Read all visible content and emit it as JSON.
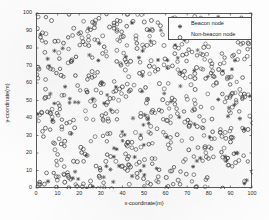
{
  "figure": {
    "title": "",
    "background_color": "#fdfdfd",
    "axes_color": "#5a5a5a"
  },
  "axes": {
    "xlabel": "x-coordinate(m)",
    "ylabel": "y-coordinate(m)",
    "xticks": [
      "0",
      "10",
      "20",
      "30",
      "40",
      "50",
      "60",
      "70",
      "80",
      "90",
      "100"
    ],
    "yticks": [
      "0",
      "10",
      "20",
      "30",
      "40",
      "50",
      "60",
      "70",
      "80",
      "90",
      "100"
    ]
  },
  "legend": {
    "position": "upper-right",
    "entries": [
      {
        "label": "Beacon node",
        "marker": "star",
        "color": "#3a3a3a"
      },
      {
        "label": "Non-beacon node",
        "marker": "circle",
        "color": "#3a3a3a"
      }
    ]
  },
  "chart_data": {
    "type": "scatter",
    "title": "",
    "xlabel": "x-coordinate(m)",
    "ylabel": "y-coordinate(m)",
    "xlim": [
      0,
      100
    ],
    "ylim": [
      0,
      100
    ],
    "xticks": [
      0,
      10,
      20,
      30,
      40,
      50,
      60,
      70,
      80,
      90,
      100
    ],
    "yticks": [
      0,
      10,
      20,
      30,
      40,
      50,
      60,
      70,
      80,
      90,
      100
    ],
    "grid": false,
    "legend_position": "upper right",
    "marker_color": "#3a3a3a",
    "series": [
      {
        "name": "Non-beacon node",
        "marker": "circle",
        "count": 560,
        "distribution": "uniform-random over 100x100 m area",
        "seed": 20240517
      },
      {
        "name": "Beacon node",
        "marker": "star",
        "count": 110,
        "distribution": "uniform-random over 100x100 m area",
        "seed": 987654
      }
    ]
  }
}
